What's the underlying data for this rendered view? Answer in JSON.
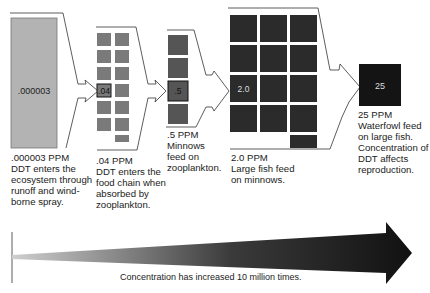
{
  "stages": [
    {
      "id": "water",
      "box_value": ".000003",
      "ppm_label": ".000003 PPM",
      "description": "DDT enters the\necosystem through\nrunoff and wind-\nborne spray.",
      "color": "#b3b3b3",
      "cell_count": 1
    },
    {
      "id": "zooplankton",
      "box_value": ".04",
      "ppm_label": ".04 PPM",
      "description": "DDT enters the\nfood chain when\nabsorbed by\nzooplankton.",
      "color": "#7a7a7a",
      "cell_count": 13
    },
    {
      "id": "minnows",
      "box_value": ".5",
      "ppm_label": ".5 PPM",
      "description": "Minnows\nfeed on\nzooplankton.",
      "color": "#555555",
      "cell_count": 4
    },
    {
      "id": "large-fish",
      "box_value": "2.0",
      "ppm_label": "2.0 PPM",
      "description": "Large fish feed\non minnows.",
      "color": "#2b2b2b",
      "cell_count": 13
    },
    {
      "id": "waterfowl",
      "box_value": "25",
      "ppm_label": "25 PPM",
      "description": "Waterfowl feed\non large fish.\nConcentration of\nDDT affects\nreproduction.",
      "color": "#141414",
      "cell_count": 1
    }
  ],
  "concentration_arrow": {
    "label": "Concentration has increased 10 million times.",
    "start_color": "#cfcfcf",
    "end_color": "#111111"
  }
}
